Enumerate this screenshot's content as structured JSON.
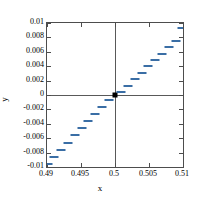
{
  "chart_data": {
    "type": "scatter",
    "title": "",
    "xlabel": "x",
    "ylabel": "y",
    "xlim": [
      0.49,
      0.51
    ],
    "ylim": [
      -0.01,
      0.01
    ],
    "xticks": [
      "0.49",
      "0.495",
      "0.5",
      "0.505",
      "0.51"
    ],
    "xtick_values": [
      0.49,
      0.495,
      0.5,
      0.505,
      0.51
    ],
    "yticks": [
      "0.01",
      "0.008",
      "0.006",
      "0.004",
      "0.002",
      "0",
      "-0.002",
      "-0.004",
      "-0.006",
      "-0.008",
      "-0.01"
    ],
    "ytick_values": [
      0.01,
      0.008,
      0.006,
      0.004,
      0.002,
      0,
      -0.002,
      -0.004,
      -0.006,
      -0.008,
      -0.01
    ],
    "grid": false,
    "legend": null,
    "marker_style": "horizontal-dash",
    "marker_color": "#3a6ea5",
    "origin_marker_color": "#000000",
    "zero_lines": {
      "x": 0.5,
      "y": 0
    },
    "series": [
      {
        "name": "data",
        "x": [
          0.4901,
          0.4911,
          0.4921,
          0.4931,
          0.4941,
          0.4951,
          0.4961,
          0.4971,
          0.4981,
          0.4991,
          0.5,
          0.5009,
          0.5019,
          0.5029,
          0.5039,
          0.5049,
          0.5059,
          0.5069,
          0.5079,
          0.5089,
          0.5098
        ],
        "y": [
          -0.0096,
          -0.0086,
          -0.0076,
          -0.0066,
          -0.0056,
          -0.0046,
          -0.0036,
          -0.0026,
          -0.0016,
          -0.0007,
          0.0,
          0.0004,
          0.0013,
          0.0022,
          0.0031,
          0.004,
          0.0049,
          0.0057,
          0.0066,
          0.0075,
          0.0093
        ]
      }
    ],
    "origin_point": {
      "x": 0.5,
      "y": 0
    }
  }
}
